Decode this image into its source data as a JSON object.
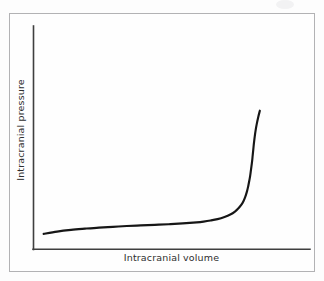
{
  "figure": {
    "background_color": "#fdfdfd",
    "frame_color": "#b2b2b4",
    "axis_color": "#3f3f3f",
    "curve_color": "#161616",
    "label_color": "#2e2e2e"
  },
  "chart_data": {
    "type": "line",
    "title": "",
    "subtitle": "",
    "xlabel": "Intracranial volume",
    "ylabel": "Intracranial pressure",
    "x_tick_labels": [],
    "y_tick_labels": [],
    "grid": false,
    "legend": [],
    "legend_position": "none",
    "annotations": [],
    "axis_style": "two-sided-L",
    "xlim": [
      0,
      100
    ],
    "ylim": [
      0,
      100
    ],
    "series": [
      {
        "name": "Intracranial pressure-volume curve",
        "description": "Monoexponential compliance curve: near-flat compensated phase followed by a steep decompensated rise",
        "x": [
          2.2,
          8,
          14,
          20,
          26,
          32,
          38,
          44,
          50,
          56,
          62,
          68,
          71,
          74,
          77,
          80,
          82.5,
          84.5,
          86,
          87.2,
          88.2,
          89,
          89.7,
          90.2,
          90.6,
          91,
          91.3,
          91.6,
          91.9,
          92.1,
          92.3,
          92.5,
          92.7,
          93,
          93.4,
          93.9,
          94.5,
          95.2
        ],
        "y": [
          9.8,
          11.3,
          12.4,
          13.2,
          13.9,
          14.4,
          14.9,
          15.3,
          15.7,
          16.1,
          16.6,
          17.3,
          17.8,
          18.5,
          19.4,
          20.8,
          22.4,
          24.3,
          26.4,
          28.6,
          31.2,
          34.2,
          37.6,
          40.8,
          43.8,
          47.2,
          50.4,
          53.8,
          57.4,
          60.4,
          63.4,
          66.4,
          69.2,
          73.0,
          77.2,
          81.4,
          85.6,
          89.8
        ]
      }
    ]
  },
  "axes": {
    "x_axis_label": "Intracranial volume",
    "y_axis_label": "Intracranial pressure"
  }
}
